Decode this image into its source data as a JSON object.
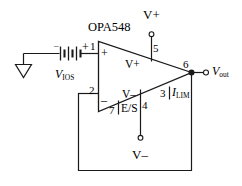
{
  "diagram": {
    "part_label": "OPA548",
    "line_color": "#1a1a1a",
    "text_color": "#000000",
    "background": "#ffffff"
  },
  "source": {
    "name": "battery-voltage-source",
    "label_main": "V",
    "label_sub": "IOS",
    "terminal_minus": "–",
    "terminal_plus": "+"
  },
  "ground": {
    "name": "ground-symbol",
    "label": ""
  },
  "opamp": {
    "part": "OPA548",
    "noninverting_sign": "+",
    "inverting_sign": "–",
    "supply_pos_label": "V+",
    "supply_neg_label": "V–",
    "pins": [
      {
        "number": "1",
        "function": "non-inverting-input"
      },
      {
        "number": "2",
        "function": "inverting-input"
      },
      {
        "number": "3",
        "function": "current-limit"
      },
      {
        "number": "4",
        "function": "negative-supply"
      },
      {
        "number": "5",
        "function": "positive-supply"
      },
      {
        "number": "6",
        "function": "output"
      },
      {
        "number": "7",
        "function": "enable-status"
      }
    ]
  },
  "labels": {
    "ilim_main": "I",
    "ilim_sub": "LIM",
    "enable_status": "E/S",
    "vout_main": "V",
    "vout_sub": "out",
    "rail_positive": "V+",
    "rail_negative": "V–"
  },
  "terminals": {
    "vplus_supply": "V+",
    "vminus_supply": "V–",
    "output": "Vout"
  }
}
